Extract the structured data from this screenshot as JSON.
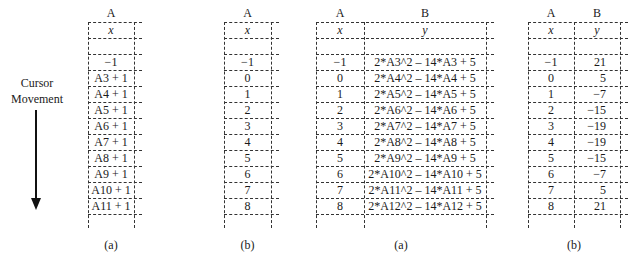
{
  "cursor": {
    "label_line1": "Cursor",
    "label_line2": "Movement",
    "icon": "down-arrow-icon"
  },
  "tables": [
    {
      "id": "left-a",
      "caption": "(a)",
      "columns": [
        {
          "letter": "A",
          "header": "x"
        }
      ],
      "rows": [
        [
          "−1"
        ],
        [
          "A3 + 1"
        ],
        [
          "A4 + 1"
        ],
        [
          "A5 + 1"
        ],
        [
          "A6 + 1"
        ],
        [
          "A7 + 1"
        ],
        [
          "A8 + 1"
        ],
        [
          "A9 + 1"
        ],
        [
          "A10 + 1"
        ],
        [
          "A11 + 1"
        ]
      ]
    },
    {
      "id": "left-b",
      "caption": "(b)",
      "columns": [
        {
          "letter": "A",
          "header": "x"
        }
      ],
      "rows": [
        [
          "−1"
        ],
        [
          "0"
        ],
        [
          "1"
        ],
        [
          "2"
        ],
        [
          "3"
        ],
        [
          "4"
        ],
        [
          "5"
        ],
        [
          "6"
        ],
        [
          "7"
        ],
        [
          "8"
        ]
      ]
    },
    {
      "id": "right-a",
      "caption": "(a)",
      "columns": [
        {
          "letter": "A",
          "header": "x"
        },
        {
          "letter": "B",
          "header": "y"
        }
      ],
      "rows": [
        [
          "−1",
          "2*A3^2 – 14*A3 + 5"
        ],
        [
          "0",
          "2*A4^2 – 14*A4 + 5"
        ],
        [
          "1",
          "2*A5^2 – 14*A5 + 5"
        ],
        [
          "2",
          "2*A6^2 – 14*A6 + 5"
        ],
        [
          "3",
          "2*A7^2 – 14*A7 + 5"
        ],
        [
          "4",
          "2*A8^2 – 14*A8 + 5"
        ],
        [
          "5",
          "2*A9^2 – 14*A9 + 5"
        ],
        [
          "6",
          "2*A10^2 – 14*A10 + 5"
        ],
        [
          "7",
          "2*A11^2 – 14*A11 + 5"
        ],
        [
          "8",
          "2*A12^2 – 14*A12 + 5"
        ]
      ]
    },
    {
      "id": "right-b",
      "caption": "(b)",
      "columns": [
        {
          "letter": "A",
          "header": "x"
        },
        {
          "letter": "B",
          "header": "y"
        }
      ],
      "rows": [
        [
          "−1",
          "21"
        ],
        [
          "0",
          "5"
        ],
        [
          "1",
          "−7"
        ],
        [
          "2",
          "−15"
        ],
        [
          "3",
          "−19"
        ],
        [
          "4",
          "−19"
        ],
        [
          "5",
          "−15"
        ],
        [
          "6",
          "−7"
        ],
        [
          "7",
          "5"
        ],
        [
          "8",
          "21"
        ]
      ]
    }
  ]
}
